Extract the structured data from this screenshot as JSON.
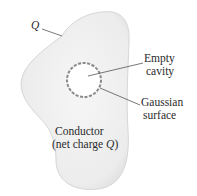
{
  "diagram": {
    "conductor_label_line1": "Conductor",
    "conductor_label_line2_prefix": "(net charge ",
    "conductor_label_line2_symbol": "Q",
    "conductor_label_line2_suffix": ")",
    "surface_charge_label": "Q",
    "cavity_label_line1": "Empty",
    "cavity_label_line2": "cavity",
    "gaussian_label_line1": "Gaussian",
    "gaussian_label_line2": "surface"
  },
  "colors": {
    "conductor_fill": "#ececec",
    "conductor_edge": "#d4d4d4",
    "gaussian_dash": "#8a8a8a",
    "leader_line": "#555555",
    "text": "#2a2a2a"
  }
}
